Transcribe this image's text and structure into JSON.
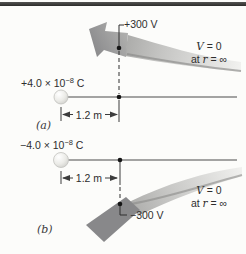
{
  "figure": {
    "type": "physics-textbook-diagram",
    "colors": {
      "background": "#fcfcfa",
      "top_rule": "#3a3a3a",
      "ribbon_light": "#f1f1ef",
      "ribbon_mid": "#c6c6c4",
      "ribbon_dark": "#98989a",
      "line": "#333333",
      "text": "#2e2e2e"
    }
  },
  "panel_a": {
    "label": "(a)",
    "charge_base": "+4.0 × 10",
    "charge_exp": "−8",
    "charge_unit": " C",
    "potential": "+300 V",
    "distance": "1.2 m",
    "v_var": "V",
    "v_rest": " = 0",
    "at_word": "at ",
    "r_var": "r",
    "r_rest": " = ∞"
  },
  "panel_b": {
    "label": "(b)",
    "charge_base": "−4.0 × 10",
    "charge_exp": "−8",
    "charge_unit": " C",
    "potential": "−300 V",
    "distance": "1.2 m",
    "v_var": "V",
    "v_rest": " = 0",
    "at_word": "at ",
    "r_var": "r",
    "r_rest": " = ∞"
  }
}
